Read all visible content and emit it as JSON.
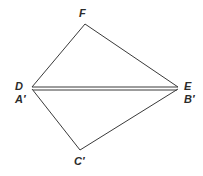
{
  "figure": {
    "type": "geometry-diagram",
    "background_color": "#ffffff",
    "stroke_color": "#3a3a3a",
    "label_color": "#2b2b2b",
    "width": 203,
    "height": 176,
    "vertices": [
      {
        "id": "F",
        "label": "F",
        "x": 85,
        "y": 24
      },
      {
        "id": "D",
        "label": "D",
        "x": 32,
        "y": 88
      },
      {
        "id": "A'",
        "label": "A′",
        "x": 32,
        "y": 88
      },
      {
        "id": "E",
        "label": "E",
        "x": 178,
        "y": 88
      },
      {
        "id": "B'",
        "label": "B′",
        "x": 178,
        "y": 88
      },
      {
        "id": "C'",
        "label": "C′",
        "x": 80,
        "y": 150
      }
    ],
    "edges": [
      {
        "id": "DF",
        "from": "D",
        "to": "F",
        "x1": 32,
        "y1": 87,
        "x2": 85,
        "y2": 24
      },
      {
        "id": "FE",
        "from": "F",
        "to": "E",
        "x1": 85,
        "y1": 24,
        "x2": 178,
        "y2": 87
      },
      {
        "id": "DE",
        "from": "D",
        "to": "E",
        "x1": 32,
        "y1": 87,
        "x2": 178,
        "y2": 87
      },
      {
        "id": "A'B'",
        "from": "A'",
        "to": "B'",
        "x1": 33,
        "y1": 90,
        "x2": 177,
        "y2": 90
      },
      {
        "id": "A'C'",
        "from": "A'",
        "to": "C'",
        "x1": 32,
        "y1": 90,
        "x2": 80,
        "y2": 150
      },
      {
        "id": "C'B'",
        "from": "C'",
        "to": "B'",
        "x1": 80,
        "y1": 150,
        "x2": 178,
        "y2": 90
      }
    ],
    "labels": {
      "apex_top": "F",
      "left_upper": "D",
      "left_lower": "A′",
      "right_upper": "E",
      "right_lower": "B′",
      "apex_bottom": "C′"
    }
  }
}
